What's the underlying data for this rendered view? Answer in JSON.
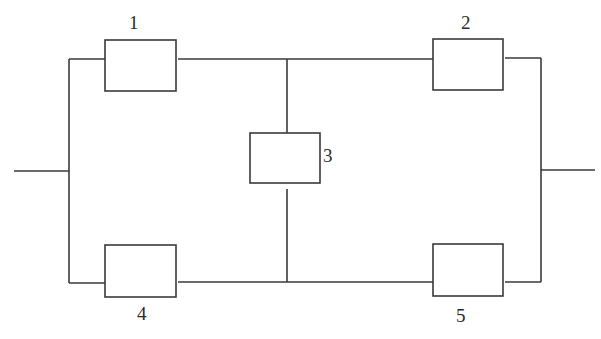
{
  "diagram": {
    "type": "bridge-network",
    "colors": {
      "line": "#3a3a3a",
      "text": "#2a2a2a",
      "background": "#ffffff"
    },
    "nodes": [
      {
        "id": "1",
        "label": "1",
        "x": 105,
        "y": 40,
        "w": 71,
        "h": 51,
        "label_x": 135,
        "label_y": 29
      },
      {
        "id": "2",
        "label": "2",
        "x": 433,
        "y": 39,
        "w": 70,
        "h": 51,
        "label_x": 461,
        "label_y": 29
      },
      {
        "id": "3",
        "label": "3",
        "x": 250,
        "y": 133,
        "w": 70,
        "h": 50,
        "label_x": 323,
        "label_y": 161
      },
      {
        "id": "4",
        "label": "4",
        "x": 105,
        "y": 245,
        "w": 71,
        "h": 52,
        "label_x": 137,
        "label_y": 320
      },
      {
        "id": "5",
        "label": "5",
        "x": 433,
        "y": 244,
        "w": 70,
        "h": 52,
        "label_x": 456,
        "label_y": 322
      }
    ],
    "edges": [
      {
        "from": "input",
        "to": "left-bus"
      },
      {
        "from": "left-bus",
        "to": "1"
      },
      {
        "from": "left-bus",
        "to": "4"
      },
      {
        "from": "1",
        "to": "top-junction"
      },
      {
        "from": "top-junction",
        "to": "2"
      },
      {
        "from": "top-junction",
        "to": "3"
      },
      {
        "from": "3",
        "to": "bottom-junction"
      },
      {
        "from": "4",
        "to": "bottom-junction"
      },
      {
        "from": "bottom-junction",
        "to": "5"
      },
      {
        "from": "2",
        "to": "right-bus"
      },
      {
        "from": "5",
        "to": "right-bus"
      },
      {
        "from": "right-bus",
        "to": "output"
      }
    ]
  }
}
